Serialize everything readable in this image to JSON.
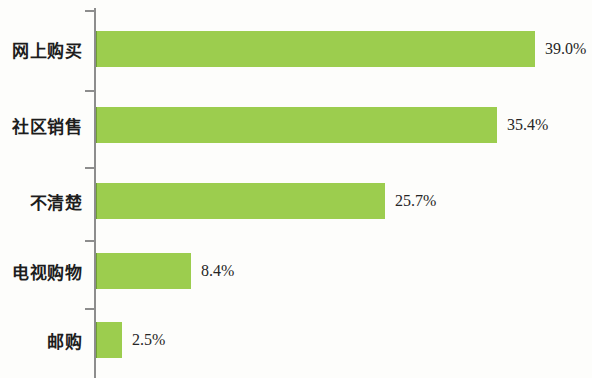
{
  "chart_data": {
    "type": "bar",
    "orientation": "horizontal",
    "title": "",
    "subtitle": "",
    "xlabel": "",
    "ylabel": "",
    "grid": false,
    "legend": null,
    "axis_color": "#8d8d8d",
    "bar_color": "#9ccd4e",
    "background_color": "#fdfdfb",
    "xlim": [
      0,
      39.0
    ],
    "categories": [
      "网上购买",
      "社区销售",
      "不清楚",
      "电视购物",
      "邮购"
    ],
    "values": [
      39.0,
      35.4,
      25.7,
      8.4,
      2.5
    ],
    "value_labels": [
      "39.0%",
      "35.4%",
      "25.7%",
      "8.4%",
      "2.5%"
    ],
    "bars": [
      {
        "category": "网上购买",
        "value": 39.0,
        "label": "39.0%",
        "bar_width_px": 438,
        "row_top_px": 29
      },
      {
        "category": "社区销售",
        "value": 35.4,
        "label": "35.4%",
        "bar_width_px": 400,
        "row_top_px": 105
      },
      {
        "category": "不清楚",
        "value": 25.7,
        "label": "25.7%",
        "bar_width_px": 288,
        "row_top_px": 181
      },
      {
        "category": "电视购物",
        "value": 8.4,
        "label": "8.4%",
        "bar_width_px": 94,
        "row_top_px": 251
      },
      {
        "category": "邮购",
        "value": 2.5,
        "label": "2.5%",
        "bar_width_px": 25,
        "row_top_px": 320
      }
    ],
    "axis_ticks_y_px": [
      10,
      90,
      167,
      240,
      308
    ]
  }
}
